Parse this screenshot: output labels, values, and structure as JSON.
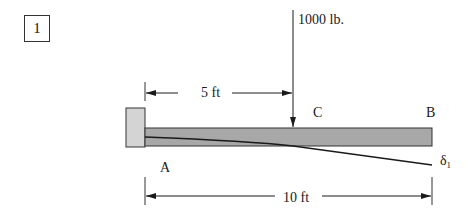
{
  "problem": {
    "number": "1"
  },
  "diagram": {
    "type": "cantilever-beam",
    "load": {
      "label": "1000 lb.",
      "position_label": "C"
    },
    "points": {
      "fixed_end": "A",
      "free_end": "B",
      "load_point": "C"
    },
    "deflection": {
      "symbol": "δ",
      "subscript": "1"
    },
    "dimensions": {
      "a_to_c": "5 ft",
      "a_to_b": "10 ft"
    },
    "colors": {
      "beam_fill": "#a8a8a8",
      "wall_fill": "#d4d4d4",
      "line": "#1a1a1a"
    }
  }
}
